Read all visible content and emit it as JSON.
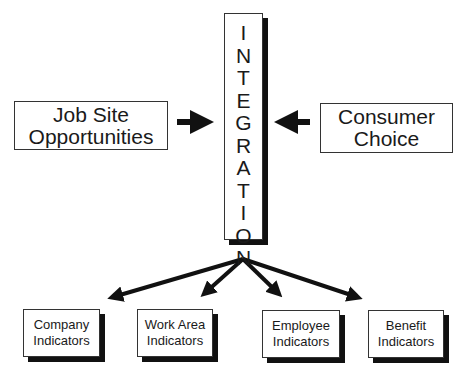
{
  "center": {
    "label": "INTEGRATION",
    "letters": [
      "I",
      "N",
      "T",
      "E",
      "G",
      "R",
      "A",
      "T",
      "I",
      "O",
      "N"
    ]
  },
  "inputs": [
    {
      "line1": "Job Site",
      "line2": "Opportunities"
    },
    {
      "line1": "Consumer",
      "line2": "Choice"
    }
  ],
  "outputs": [
    {
      "line1": "Company",
      "line2": "Indicators"
    },
    {
      "line1": "Work Area",
      "line2": "Indicators"
    },
    {
      "line1": "Employee",
      "line2": "Indicators"
    },
    {
      "line1": "Benefit",
      "line2": "Indicators"
    }
  ],
  "colors": {
    "line": "#111111",
    "background": "#ffffff"
  }
}
